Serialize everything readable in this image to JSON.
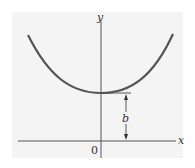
{
  "diagram": {
    "axes": {
      "x_label": "x",
      "y_label": "y",
      "origin_label": "0"
    },
    "curve": {
      "type": "catenary-like U curve",
      "vertex_label": "b",
      "color": "#555555"
    },
    "colors": {
      "panel": "#f4f4f4",
      "axis": "#555555",
      "text": "#333333"
    }
  }
}
